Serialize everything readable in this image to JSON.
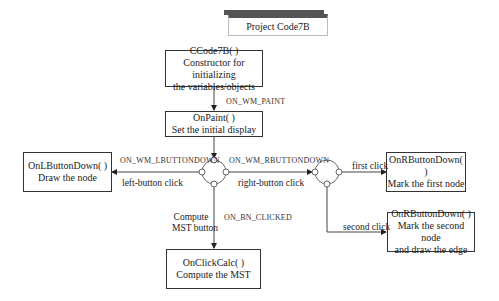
{
  "title": "Project Code7B",
  "nodes": {
    "constructor": {
      "name": "CCode7B( )",
      "desc": [
        "Constructor for initializing",
        "the variables/objects"
      ]
    },
    "onpaint": {
      "name": "OnPaint( )",
      "desc": [
        "Set the initial display"
      ]
    },
    "lbutton": {
      "name": "OnLButtonDown( )",
      "desc": [
        "Draw the node"
      ]
    },
    "rbutton1": {
      "name": "OnRButtonDown( )",
      "desc": [
        "Mark the first node"
      ]
    },
    "rbutton2": {
      "name": "OnRButtonDown( )",
      "desc": [
        "Mark the second node",
        "and draw the edge"
      ]
    },
    "calc": {
      "name": "OnClickCalc( )",
      "desc": [
        "Compute the MST"
      ]
    }
  },
  "edges": {
    "paint_msg": "ON_WM_PAINT",
    "lbutton_msg": "ON_WM_LBUTTONDOWN",
    "lbutton_action": "left-button click",
    "rbutton_msg": "ON_WM_RBUTTONDOWN",
    "rbutton_action": "right-button click",
    "first_click": "first click",
    "second_click": "second click",
    "bn_msg": "ON_BN_CLICKED",
    "bn_action_1": "Compute",
    "bn_action_2": "MST button"
  }
}
